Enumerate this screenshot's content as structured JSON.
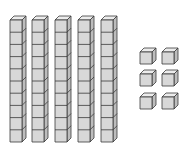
{
  "diagram": {
    "type": "base-ten-blocks",
    "represented_value": 56,
    "tens_rods": 5,
    "cubes_per_rod": 10,
    "unit_cubes": 6,
    "colors": {
      "front": "#d8d8d8",
      "top": "#ececec",
      "side": "#bdbdbd",
      "stroke": "#3a3a3a",
      "background": "#ffffff"
    },
    "rods": [
      {
        "x": 10,
        "y": 20
      },
      {
        "x": 32,
        "y": 20
      },
      {
        "x": 55,
        "y": 20
      },
      {
        "x": 78,
        "y": 20
      },
      {
        "x": 101,
        "y": 20
      }
    ],
    "units": [
      {
        "x": 140,
        "y": 52
      },
      {
        "x": 162,
        "y": 52
      },
      {
        "x": 140,
        "y": 74
      },
      {
        "x": 162,
        "y": 74
      },
      {
        "x": 140,
        "y": 97
      },
      {
        "x": 162,
        "y": 97
      }
    ],
    "cube_size": 12,
    "depth": 4
  }
}
